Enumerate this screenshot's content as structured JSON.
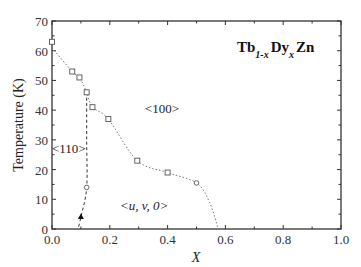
{
  "chart_data": {
    "type": "scatter",
    "title": "Tb1-xDyxZn",
    "title_parts": {
      "a": "Tb",
      "a_sub": "1-x",
      "b": "Dy",
      "b_sub": "x",
      "c": "Zn"
    },
    "xlabel": "X",
    "ylabel": "Temperature (K)",
    "xlim": [
      0.0,
      1.0
    ],
    "ylim": [
      0,
      70
    ],
    "x_ticks": [
      "0.0",
      "0.2",
      "0.4",
      "0.6",
      "0.8",
      "1.0"
    ],
    "y_ticks": [
      "0",
      "10",
      "20",
      "30",
      "40",
      "50",
      "60",
      "70"
    ],
    "grid": false,
    "legend": "none",
    "series": [
      {
        "name": "upper transition (squares, dotted)",
        "marker": "square",
        "line": "dotted",
        "x": [
          0.0,
          0.07,
          0.095,
          0.12,
          0.14,
          0.195,
          0.295,
          0.4
        ],
        "y": [
          63,
          53,
          51,
          46,
          41,
          37,
          23,
          19
        ]
      },
      {
        "name": "upper transition (circle, dotted)",
        "marker": "circle",
        "line": "dotted",
        "x": [
          0.5
        ],
        "y": [
          15.5
        ]
      },
      {
        "name": "spin reorientation (circle, dashed)",
        "marker": "circle",
        "line": "dashed",
        "x": [
          0.12
        ],
        "y": [
          14
        ]
      },
      {
        "name": "spin reorientation (triangle)",
        "marker": "triangle",
        "line": "dashed",
        "x": [
          0.1
        ],
        "y": [
          4
        ]
      }
    ],
    "curves": {
      "dotted_boundary": [
        [
          0.0,
          61
        ],
        [
          0.07,
          53
        ],
        [
          0.095,
          51
        ],
        [
          0.12,
          46
        ],
        [
          0.14,
          41
        ],
        [
          0.195,
          37
        ],
        [
          0.295,
          23
        ],
        [
          0.4,
          19
        ],
        [
          0.5,
          15.5
        ],
        [
          0.545,
          9
        ],
        [
          0.575,
          0
        ]
      ],
      "dashed_boundary": [
        [
          0.12,
          46
        ],
        [
          0.12,
          30
        ],
        [
          0.12,
          14
        ],
        [
          0.1,
          4
        ],
        [
          0.09,
          0
        ]
      ]
    },
    "annotations": [
      {
        "text": "<100>",
        "x": 0.33,
        "y": 37
      },
      {
        "text": "<110>",
        "x": 0.02,
        "y": 28
      },
      {
        "text": "<u, v, 0>",
        "x": 0.28,
        "y": 9
      }
    ]
  }
}
